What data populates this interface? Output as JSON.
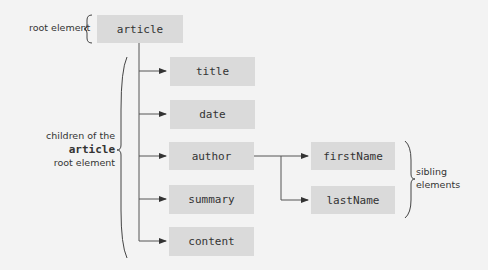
{
  "diagram": {
    "root": {
      "label": "article"
    },
    "children": [
      {
        "label": "title"
      },
      {
        "label": "date"
      },
      {
        "label": "author"
      },
      {
        "label": "summary"
      },
      {
        "label": "content"
      }
    ],
    "grandchildren": [
      {
        "label": "firstName"
      },
      {
        "label": "lastName"
      }
    ],
    "annotations": {
      "root_label": "root element",
      "children_line1": "children of the",
      "children_line2": "article",
      "children_line3": "root element",
      "siblings_line1": "sibling",
      "siblings_line2": "elements"
    },
    "colors": {
      "background": "#f3f3f3",
      "node_fill": "#dadada",
      "line": "#444444"
    }
  }
}
